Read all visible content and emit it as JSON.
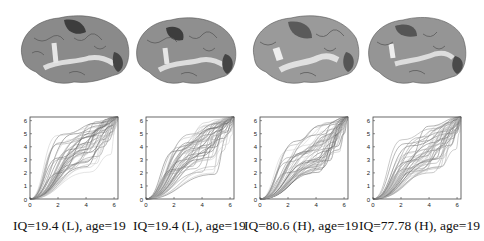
{
  "figure": {
    "brains": [
      {
        "label": "brain-1",
        "shade": "#8a8a8a"
      },
      {
        "label": "brain-2",
        "shade": "#8f8f8f"
      },
      {
        "label": "brain-3",
        "shade": "#9a9a9a"
      },
      {
        "label": "brain-4",
        "shade": "#959595"
      }
    ],
    "captions": [
      "IQ=19.4 (L), age=19",
      "IQ=19.4 (L), age=19",
      "IQ=80.6 (H), age=19",
      "IQ=77.78 (H), age=19"
    ]
  },
  "chart_data": [
    {
      "type": "line",
      "title": "",
      "caption": "IQ=19.4 (L), age=19",
      "xlim": [
        0,
        6.28
      ],
      "ylim": [
        0,
        6.28
      ],
      "xticks": [
        0,
        2,
        4,
        6
      ],
      "yticks": [
        0,
        1,
        2,
        3,
        4,
        5,
        6
      ],
      "grid": false,
      "series_description": "~40 monotone step-like curves from (0,0) to (6.28,6.28)"
    },
    {
      "type": "line",
      "title": "",
      "caption": "IQ=19.4 (L), age=19",
      "xlim": [
        0,
        6.28
      ],
      "ylim": [
        0,
        6.28
      ],
      "xticks": [
        0,
        2,
        4,
        6
      ],
      "yticks": [
        0,
        1,
        2,
        3,
        4,
        5,
        6
      ],
      "grid": false,
      "series_description": "~40 monotone step-like curves from (0,0) to (6.28,6.28)"
    },
    {
      "type": "line",
      "title": "",
      "caption": "IQ=80.6 (H), age=19",
      "xlim": [
        0,
        6.28
      ],
      "ylim": [
        0,
        6.28
      ],
      "xticks": [
        0,
        2,
        4,
        6
      ],
      "yticks": [
        0,
        1,
        2,
        3,
        4,
        5,
        6
      ],
      "grid": false,
      "series_description": "~40 monotone step-like curves from (0,0) to (6.28,6.28)"
    },
    {
      "type": "line",
      "title": "",
      "caption": "IQ=77.78 (H), age=19",
      "xlim": [
        0,
        6.28
      ],
      "ylim": [
        0,
        6.28
      ],
      "xticks": [
        0,
        2,
        4,
        6
      ],
      "yticks": [
        0,
        1,
        2,
        3,
        4,
        5,
        6
      ],
      "grid": false,
      "series_description": "~40 monotone step-like curves from (0,0) to (6.28,6.28)"
    }
  ]
}
